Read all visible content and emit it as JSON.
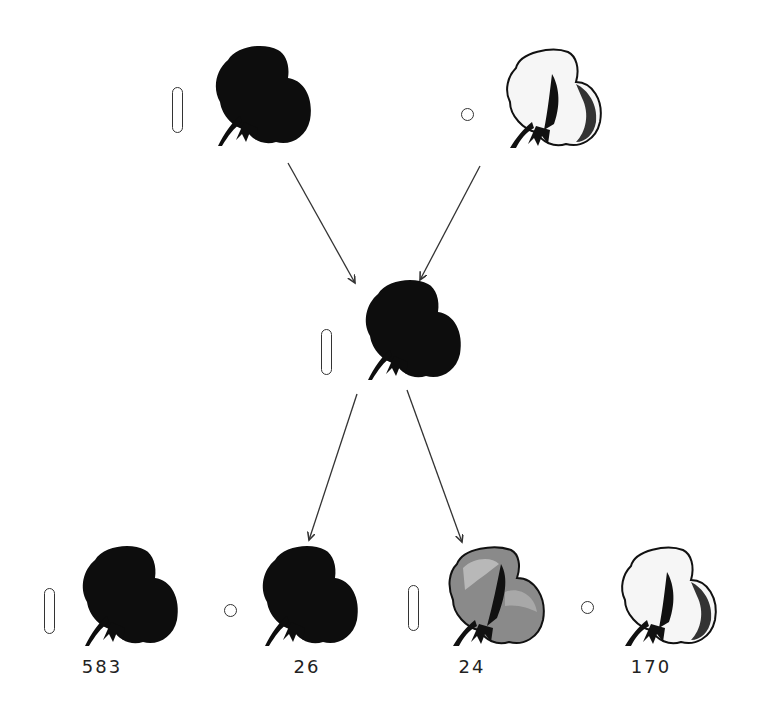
{
  "diagram": {
    "nodes": [
      {
        "id": "parent-left",
        "role": "parent",
        "flower_color": "dark",
        "pollen_shape": "long"
      },
      {
        "id": "parent-right",
        "role": "parent",
        "flower_color": "light",
        "pollen_shape": "round"
      },
      {
        "id": "f1",
        "role": "F1 hybrid",
        "flower_color": "dark",
        "pollen_shape": "long"
      },
      {
        "id": "f2-1",
        "role": "F2",
        "flower_color": "dark",
        "pollen_shape": "long",
        "count": "583"
      },
      {
        "id": "f2-2",
        "role": "F2",
        "flower_color": "dark",
        "pollen_shape": "round",
        "count": "26"
      },
      {
        "id": "f2-3",
        "role": "F2",
        "flower_color": "light",
        "pollen_shape": "long",
        "count": "24"
      },
      {
        "id": "f2-4",
        "role": "F2",
        "flower_color": "light",
        "pollen_shape": "round",
        "count": "170"
      }
    ],
    "edges": [
      {
        "from": "parent-left",
        "to": "f1"
      },
      {
        "from": "parent-right",
        "to": "f1"
      },
      {
        "from": "f1",
        "to": "f2-group-left"
      },
      {
        "from": "f1",
        "to": "f2-group-right"
      }
    ],
    "colors": {
      "dark_flower": "#0d0d0d",
      "light_flower": "#f4f4f4",
      "light_shading": "#7a7a7a",
      "line": "#333333"
    }
  }
}
